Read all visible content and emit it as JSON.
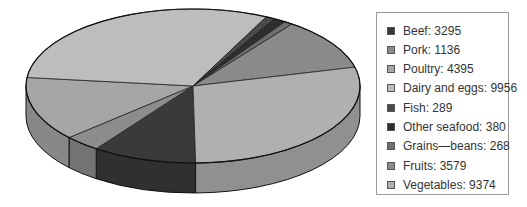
{
  "chart_data": {
    "type": "pie",
    "style": "3d",
    "title": "",
    "legend_position": "right",
    "categories": [
      "Beef",
      "Pork",
      "Poultry",
      "Dairy and eggs",
      "Fish",
      "Other seafood",
      "Grains—beans",
      "Fruits",
      "Vegetables"
    ],
    "values": [
      3295,
      1136,
      4395,
      9956,
      289,
      380,
      268,
      3579,
      9374
    ],
    "colors": [
      "#3a3a3a",
      "#8c8c8c",
      "#a6a6a6",
      "#bdbdbd",
      "#4a4a4a",
      "#2e2e2e",
      "#6e6e6e",
      "#8a8a8a",
      "#b0b0b0"
    ],
    "legend_labels": [
      "Beef: 3295",
      "Pork: 1136",
      "Poultry: 4395",
      "Dairy and eggs: 9956",
      "Fish: 289",
      "Other seafood: 380",
      "Grains—beans: 268",
      "Fruits: 3579",
      "Vegetables: 9374"
    ]
  },
  "legend": {
    "items": [
      {
        "label": "Beef: 3295",
        "color": "#3a3a3a"
      },
      {
        "label": "Pork: 1136",
        "color": "#8c8c8c"
      },
      {
        "label": "Poultry: 4395",
        "color": "#a6a6a6"
      },
      {
        "label": "Dairy and eggs: 9956",
        "color": "#bdbdbd"
      },
      {
        "label": "Fish: 289",
        "color": "#4a4a4a"
      },
      {
        "label": "Other seafood: 380",
        "color": "#2e2e2e"
      },
      {
        "label": "Grains—beans: 268",
        "color": "#6e6e6e"
      },
      {
        "label": "Fruits: 3579",
        "color": "#8a8a8a"
      },
      {
        "label": "Vegetables: 9374",
        "color": "#b0b0b0"
      }
    ]
  }
}
